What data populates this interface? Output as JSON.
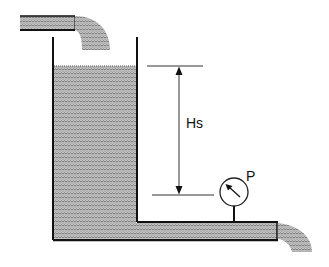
{
  "diagram": {
    "type": "hydraulic-tank-static-head",
    "labels": {
      "head": "Hs",
      "gauge": "P"
    },
    "colors": {
      "water_fill": "#b8b8b8",
      "water_wave": "#7a7a7a",
      "outline": "#111111",
      "background": "#ffffff"
    },
    "components": [
      "inlet-pipe",
      "inlet-stream",
      "tank",
      "water-body",
      "static-head-dimension",
      "pressure-gauge",
      "outlet-pipe",
      "outlet-stream"
    ]
  }
}
